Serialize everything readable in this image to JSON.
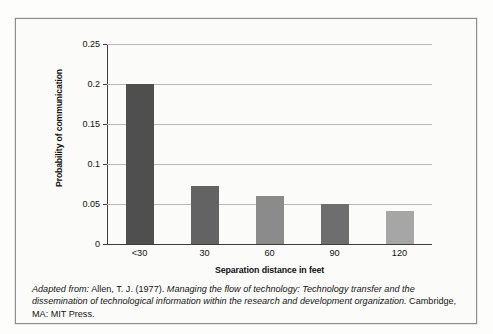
{
  "figure": {
    "caption": {
      "lead_label": "Adapted from:",
      "authors": " Allen, T. J. (1977). ",
      "title": "Managing the flow of technology: Technology transfer and the dissemination of technological information within the research and development organization.",
      "publisher": " Cambridge, MA: MIT Press."
    }
  },
  "chart_data": {
    "type": "bar",
    "title": "",
    "xlabel": "Separation distance in feet",
    "ylabel": "Probability of communication",
    "categories": [
      "<30",
      "30",
      "60",
      "90",
      "120"
    ],
    "values": [
      0.2,
      0.073,
      0.06,
      0.05,
      0.041
    ],
    "ylim": [
      0,
      0.25
    ],
    "yticks": [
      0,
      0.05,
      0.1,
      0.15,
      0.2,
      0.25
    ],
    "ytick_labels": [
      "0",
      "0.05",
      "0.1",
      "0.15",
      "0.2",
      "0.25"
    ],
    "grid": true,
    "legend": "none",
    "bar_colors": [
      "#4f4f4f",
      "#636363",
      "#8b8b8b",
      "#6e6e6e",
      "#a6a6a6"
    ]
  }
}
